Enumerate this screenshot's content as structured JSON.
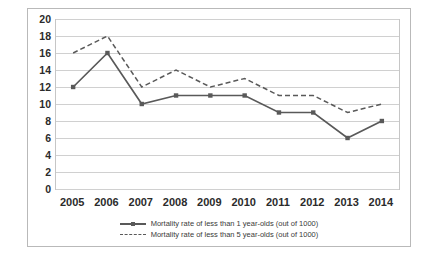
{
  "chart_data": {
    "type": "line",
    "title": "",
    "xlabel": "",
    "ylabel": "",
    "categories": [
      "2005",
      "2006",
      "2007",
      "2008",
      "2009",
      "2010",
      "2011",
      "2012",
      "2013",
      "2014"
    ],
    "ylim": [
      0,
      20
    ],
    "ytick_step": 2,
    "yticks": [
      "20",
      "18",
      "16",
      "14",
      "12",
      "10",
      "8",
      "6",
      "4",
      "2",
      "0"
    ],
    "grid": true,
    "legend_position": "bottom",
    "series": [
      {
        "name": "Mortality rate of less than 1 year-olds (out of 1000)",
        "style": "solid",
        "marker": "square",
        "color": "#595959",
        "values": [
          12,
          16,
          10,
          11,
          11,
          11,
          9,
          9,
          6,
          8
        ]
      },
      {
        "name": "Mortality rate of less than 5 year-olds (out of 1000)",
        "style": "dashed",
        "marker": "none",
        "color": "#595959",
        "values": [
          16,
          18,
          12,
          14,
          12,
          13,
          11,
          11,
          9,
          10
        ]
      }
    ]
  },
  "legend": {
    "items": [
      {
        "label": "Mortality rate of less than 1 year-olds (out of 1000)"
      },
      {
        "label": "Mortality rate of less than 5 year-olds (out of 1000)"
      }
    ]
  }
}
